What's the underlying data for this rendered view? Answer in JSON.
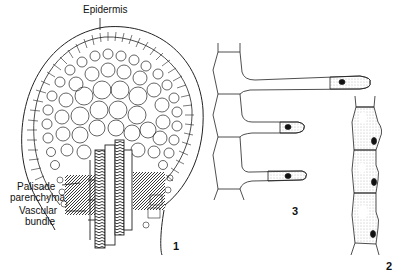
{
  "figure": {
    "panels": [
      {
        "id": "1",
        "number_label": "1",
        "description": "Cross-section of glandular structure"
      },
      {
        "id": "2",
        "number_label": "2",
        "description": "Chain of three nucleated cells"
      },
      {
        "id": "3",
        "number_label": "3",
        "description": "Cells with elongated tubular projections"
      }
    ],
    "labels": {
      "epidermis": "Epidermis",
      "palisade_line1": "Palisade",
      "palisade_line2": "parenchyma",
      "vascular_line1": "Vascular",
      "vascular_line2": "bundle"
    },
    "colors": {
      "ink": "#1a1a1a",
      "stipple": "#bdbdbd",
      "background": "#ffffff"
    }
  }
}
